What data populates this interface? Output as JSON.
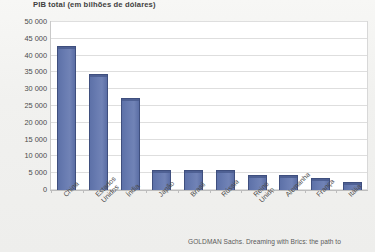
{
  "chart_data": {
    "type": "bar",
    "title": "PIB total (em bilhões de dólares)",
    "xlabel": "",
    "ylabel": "",
    "ylim": [
      0,
      50000
    ],
    "ytick_step": 5000,
    "grid": true,
    "legend": null,
    "bar_color": "#6578ad",
    "bar_border_color": "#3f4f7e",
    "categories": [
      "China",
      "Estados Unidos",
      "Índia",
      "Japão",
      "Brasil",
      "Rússia",
      "Reino Unido",
      "Alemanha",
      "França",
      "Itália"
    ],
    "values": [
      43000,
      34600,
      27500,
      6100,
      6000,
      5900,
      4500,
      4400,
      3600,
      2500
    ],
    "ytick_labels": [
      "50 000",
      "45 000",
      "40 000",
      "35 000",
      "30 000",
      "25 000",
      "20 000",
      "15 000",
      "10 000",
      "5 000",
      "0"
    ],
    "annotation": "GOLDMAN Sachs. Dreaming with Brics: the path to"
  }
}
